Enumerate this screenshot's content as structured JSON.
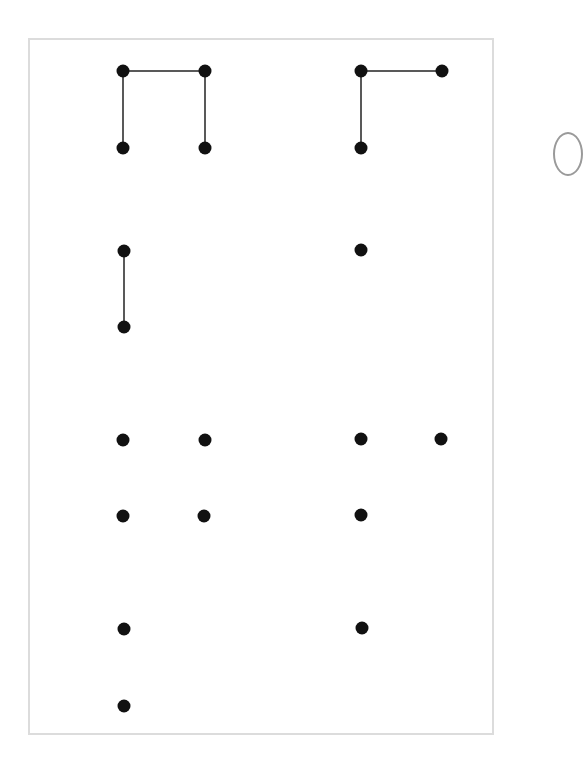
{
  "colors": {
    "dot": "#111111",
    "line": "#222222",
    "frame": "#dcdcdc",
    "background": "#ffffff"
  },
  "diagram": {
    "dot_radius": 6.5,
    "dots": [
      {
        "x": 123,
        "y": 71
      },
      {
        "x": 205,
        "y": 71
      },
      {
        "x": 123,
        "y": 148
      },
      {
        "x": 205,
        "y": 148
      },
      {
        "x": 361,
        "y": 71
      },
      {
        "x": 442,
        "y": 71
      },
      {
        "x": 361,
        "y": 148
      },
      {
        "x": 124,
        "y": 251
      },
      {
        "x": 124,
        "y": 327
      },
      {
        "x": 361,
        "y": 250
      },
      {
        "x": 123,
        "y": 440
      },
      {
        "x": 205,
        "y": 440
      },
      {
        "x": 361,
        "y": 439
      },
      {
        "x": 441,
        "y": 439
      },
      {
        "x": 123,
        "y": 516
      },
      {
        "x": 204,
        "y": 516
      },
      {
        "x": 361,
        "y": 515
      },
      {
        "x": 124,
        "y": 629
      },
      {
        "x": 362,
        "y": 628
      },
      {
        "x": 124,
        "y": 706
      }
    ],
    "lines": [
      {
        "x1": 123,
        "y1": 71,
        "x2": 205,
        "y2": 71
      },
      {
        "x1": 123,
        "y1": 71,
        "x2": 123,
        "y2": 148
      },
      {
        "x1": 205,
        "y1": 71,
        "x2": 205,
        "y2": 148
      },
      {
        "x1": 361,
        "y1": 71,
        "x2": 442,
        "y2": 71
      },
      {
        "x1": 361,
        "y1": 71,
        "x2": 361,
        "y2": 148
      },
      {
        "x1": 124,
        "y1": 251,
        "x2": 124,
        "y2": 327
      }
    ]
  }
}
